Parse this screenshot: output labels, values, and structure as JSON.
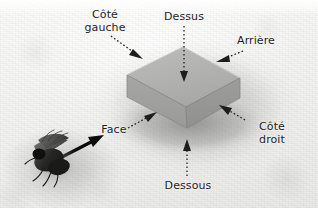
{
  "figure": {
    "language": "fr",
    "background_color": "#f2f2f0",
    "ink_color": "#1d1d1d"
  },
  "labels": {
    "cote_gauche": "Côté\ngauche",
    "dessus": "Dessus",
    "arriere": "Arrière",
    "face": "Face",
    "cote_droit": "Côté\ndroit",
    "dessous": "Dessous"
  },
  "block": {
    "name": "isometric-slab",
    "top_face_color": "#b3b3b1",
    "left_face_color": "#a0a09e",
    "right_face_color": "#989896",
    "edge_color": "#8a8a88"
  },
  "annotations": {
    "dotted_leader_color": "#1d1d1d",
    "viewer_arrow_color": "#0b0b0b",
    "viewer_arrow_style": "solid-thick"
  },
  "subject": {
    "name": "fly-specimen",
    "color": "#2a2a28"
  }
}
